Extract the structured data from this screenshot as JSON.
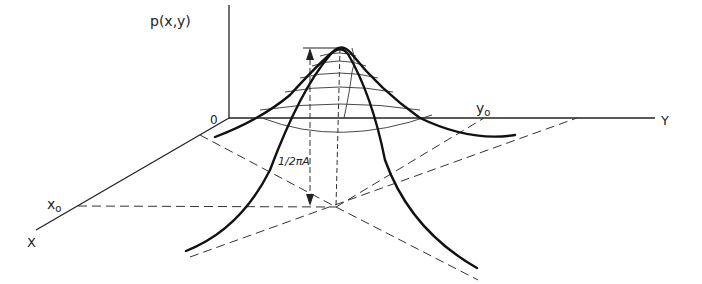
{
  "diagram": {
    "type": "3d-surface-sketch",
    "labels": {
      "z_axis": "p(x,y)",
      "origin": "0",
      "x_axis": "X",
      "y_axis": "Y",
      "x0": "x",
      "x0_sub": "o",
      "y0": "y",
      "y0_sub": "o",
      "peak_height": "1/2πA"
    },
    "colors": {
      "ink": "#222222",
      "background": "#ffffff"
    }
  }
}
